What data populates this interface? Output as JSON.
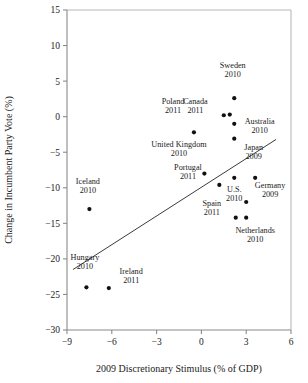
{
  "chart_data": {
    "type": "scatter",
    "title": "",
    "xlabel": "2009 Discretionary Stimulus (% of GDP)",
    "ylabel": "Change in Incumbent Party Vote (%)",
    "xlim": [
      -9,
      6
    ],
    "ylim": [
      -30,
      15
    ],
    "xticks": [
      -9,
      -6,
      -3,
      0,
      3,
      6
    ],
    "xtick_labels": [
      "−9",
      "−6",
      "−3",
      "0",
      "3",
      "6"
    ],
    "yticks": [
      -30,
      -25,
      -20,
      -15,
      -10,
      -5,
      0,
      5,
      10,
      15
    ],
    "ytick_labels": [
      "−30",
      "−25",
      "−20",
      "−15",
      "−10",
      "−5",
      "0",
      "5",
      "10",
      "15"
    ],
    "grid": false,
    "legend": "none",
    "points": [
      {
        "label": "Iceland",
        "year": "2010",
        "x": -7.5,
        "y": -13.0,
        "label_dx": -0.1,
        "label_dy": 3.6
      },
      {
        "label": "Hungary",
        "year": "2010",
        "x": -7.7,
        "y": -24.0,
        "label_dx": -0.1,
        "label_dy": 3.8
      },
      {
        "label": "Ireland",
        "year": "2011",
        "x": -6.2,
        "y": -24.1,
        "label_dx": 1.5,
        "label_dy": 2.0
      },
      {
        "label": "Poland",
        "year": "2011",
        "x": -0.5,
        "y": -2.2,
        "label_dx": -1.4,
        "label_dy": 4.0
      },
      {
        "label": "United Kingdom",
        "year": "2010",
        "x": 0.2,
        "y": -8.0,
        "label_dx": -1.7,
        "label_dy": 3.7
      },
      {
        "label": "Portugal",
        "year": "2011",
        "x": 1.2,
        "y": -9.6,
        "label_dx": -2.1,
        "label_dy": 2.1
      },
      {
        "label": "Canada",
        "year": "2011",
        "x": 1.5,
        "y": 0.2,
        "label_dx": -1.9,
        "label_dy": 1.6
      },
      {
        "label": "Sweden",
        "year": "2010",
        "x": 2.2,
        "y": 2.6,
        "label_dx": -0.1,
        "label_dy": 4.2
      },
      {
        "label": "U.S.",
        "year": "2010",
        "x": 2.2,
        "y": -8.6,
        "label_dx": 0.0,
        "label_dy": -2.0
      },
      {
        "label": "Australia",
        "year": "2010",
        "x": 2.2,
        "y": -3.1,
        "label_dx": 1.7,
        "label_dy": 2.1
      },
      {
        "label": "Spain",
        "year": "2011",
        "x": 2.3,
        "y": -14.2,
        "label_dx": -1.6,
        "label_dy": 1.6
      },
      {
        "label": "Netherlands",
        "year": "2010",
        "x": 3.0,
        "y": -14.2,
        "label_dx": 0.6,
        "label_dy": -2.1
      },
      {
        "label": "Germany",
        "year": "2009",
        "x": 3.0,
        "y": -12.0,
        "label_dx": 1.6,
        "label_dy": 1.9
      },
      {
        "label": "Japan",
        "year": "2009",
        "x": 3.6,
        "y": -8.6,
        "label_dx": -0.1,
        "label_dy": 3.9
      }
    ],
    "unlabeled_points": [
      {
        "x": 1.9,
        "y": 0.3
      },
      {
        "x": 2.2,
        "y": -1.0
      }
    ],
    "trendline": {
      "x0": -8.6,
      "y0": -21.5,
      "x1": 5.0,
      "y1": -3.2
    }
  }
}
